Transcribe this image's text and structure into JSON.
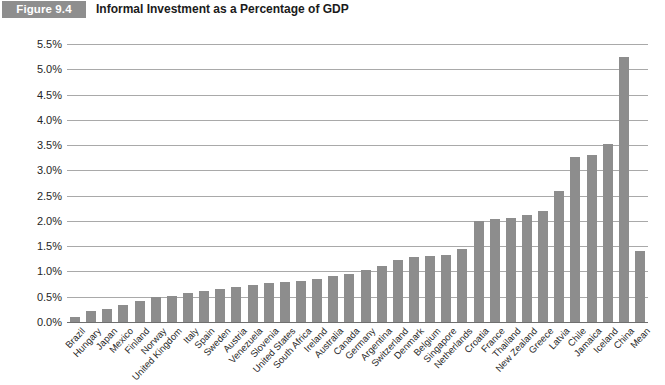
{
  "figure": {
    "badge": "Figure 9.4",
    "title": "Informal Investment as a Percentage of GDP"
  },
  "colors": {
    "bar": "#8d8d8d",
    "badge_background": "#8e8e8e",
    "badge_text": "#ffffff",
    "gridline": "#a9a9a9",
    "axis": "#6f6f6f",
    "text": "#252525",
    "background": "#ffffff"
  },
  "chart_data": {
    "type": "bar",
    "title": "Informal Investment as a Percentage of GDP",
    "xlabel": "",
    "ylabel": "",
    "ylim": [
      0.0,
      5.5
    ],
    "ytick_step": 0.5,
    "grid": true,
    "legend": false,
    "value_unit": "percent",
    "ytick_labels": [
      "0.0%",
      "0.5%",
      "1.0%",
      "1.5%",
      "2.0%",
      "2.5%",
      "3.0%",
      "3.5%",
      "4.0%",
      "4.5%",
      "5.0%",
      "5.5%"
    ],
    "ytick_values": [
      0.0,
      0.5,
      1.0,
      1.5,
      2.0,
      2.5,
      3.0,
      3.5,
      4.0,
      4.5,
      5.0,
      5.5
    ],
    "categories": [
      "Brazil",
      "Hungary",
      "Japan",
      "Mexico",
      "Finland",
      "Norway",
      "United Kingdom",
      "Italy",
      "Spain",
      "Sweden",
      "Austria",
      "Venezuela",
      "Slovenia",
      "United States",
      "South Africa",
      "Ireland",
      "Australia",
      "Canada",
      "Germany",
      "Argentina",
      "Switzerland",
      "Denmark",
      "Belgium",
      "Singapore",
      "Netherlands",
      "Croatia",
      "France",
      "Thailand",
      "New Zealand",
      "Greece",
      "Latvia",
      "Chile",
      "Jamaica",
      "Iceland",
      "China",
      "Mean"
    ],
    "values": [
      0.1,
      0.22,
      0.25,
      0.33,
      0.42,
      0.5,
      0.52,
      0.58,
      0.62,
      0.66,
      0.7,
      0.74,
      0.78,
      0.8,
      0.82,
      0.85,
      0.92,
      0.95,
      1.02,
      1.1,
      1.22,
      1.28,
      1.3,
      1.32,
      1.45,
      2.0,
      2.04,
      2.06,
      2.12,
      2.2,
      2.6,
      3.26,
      3.3,
      3.52,
      5.25,
      1.4
    ]
  }
}
